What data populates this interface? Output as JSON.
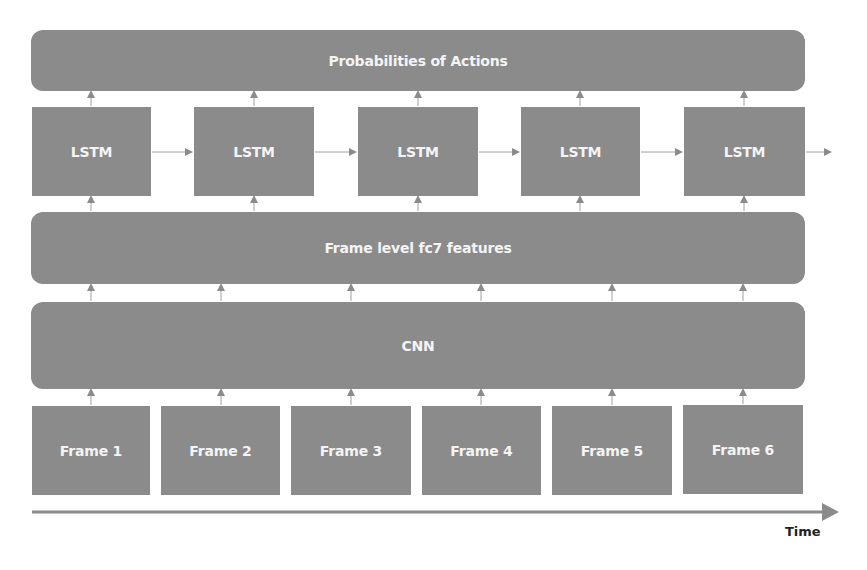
{
  "diagram": {
    "type": "CNN-LSTM action recognition pipeline",
    "layers": {
      "output": {
        "label": "Probabilities of Actions"
      },
      "lstm": {
        "labels": [
          "LSTM",
          "LSTM",
          "LSTM",
          "LSTM",
          "LSTM"
        ]
      },
      "features": {
        "label": "Frame level fc7 features"
      },
      "cnn": {
        "label": "CNN"
      },
      "frames": {
        "labels": [
          "Frame 1",
          "Frame 2",
          "Frame 3",
          "Frame 4",
          "Frame 5",
          "Frame 6"
        ]
      }
    },
    "time_axis": {
      "label": "Time"
    },
    "colors": {
      "box_fill": "#8b8b8b",
      "box_text": "#f4f4f4",
      "arrow": "#8b8b8b",
      "axis": "#8b8b8b"
    }
  }
}
